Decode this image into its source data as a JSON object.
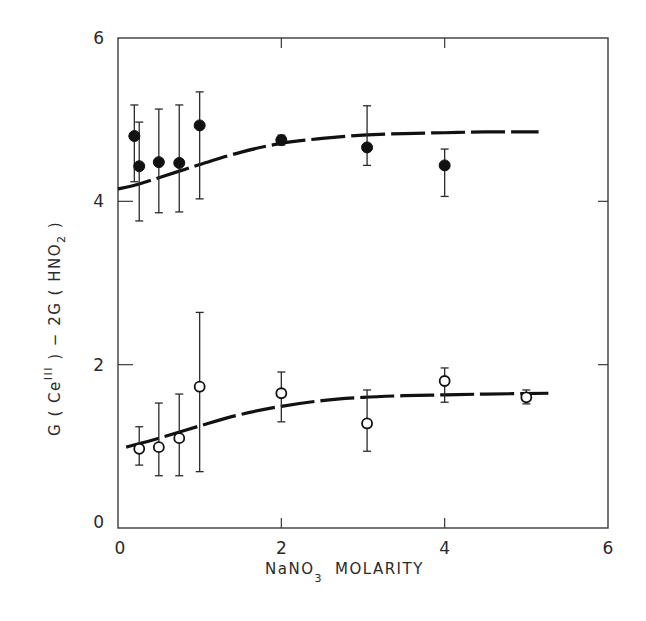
{
  "chart_data": {
    "type": "scatter",
    "title": "",
    "xlabel": "NaNO3 MOLARITY",
    "xlabel_parts": {
      "main": "NaNO",
      "sub": "3",
      "rest": "MOLARITY"
    },
    "ylabel": "G(Ce^III) - 2G(HNO2)",
    "ylabel_parts": [
      "G ( Ce",
      "III",
      " ) − 2G ( HNO",
      "2",
      " )"
    ],
    "xlim": [
      0,
      6
    ],
    "ylim": [
      0,
      6
    ],
    "x_ticks": [
      0,
      2,
      4,
      6
    ],
    "y_ticks": [
      0,
      2,
      4,
      6
    ],
    "x_tick_labels": [
      "0",
      "2",
      "4",
      "6"
    ],
    "y_tick_labels": [
      "0",
      "2",
      "4",
      "6"
    ],
    "grid": false,
    "legend": null,
    "series": [
      {
        "name": "filled circles (upper)",
        "marker": "filled-circle",
        "color": "#111111",
        "points": [
          {
            "x": 0.2,
            "y": 4.8,
            "err_low": 4.24,
            "err_high": 5.18
          },
          {
            "x": 0.26,
            "y": 4.43,
            "err_low": 3.76,
            "err_high": 4.97
          },
          {
            "x": 0.5,
            "y": 4.48,
            "err_low": 3.86,
            "err_high": 5.13
          },
          {
            "x": 0.75,
            "y": 4.47,
            "err_low": 3.87,
            "err_high": 5.18
          },
          {
            "x": 1.0,
            "y": 4.93,
            "err_low": 4.03,
            "err_high": 5.34
          },
          {
            "x": 2.0,
            "y": 4.75,
            "err_low": 4.69,
            "err_high": 4.81
          },
          {
            "x": 3.05,
            "y": 4.66,
            "err_low": 4.44,
            "err_high": 5.17
          },
          {
            "x": 4.0,
            "y": 4.44,
            "err_low": 4.06,
            "err_high": 4.64
          }
        ],
        "fit_curve": [
          [
            0.0,
            4.15
          ],
          [
            0.25,
            4.21
          ],
          [
            0.5,
            4.29
          ],
          [
            0.75,
            4.37
          ],
          [
            1.0,
            4.45
          ],
          [
            1.5,
            4.6
          ],
          [
            2.0,
            4.71
          ],
          [
            2.5,
            4.77
          ],
          [
            3.0,
            4.81
          ],
          [
            3.5,
            4.83
          ],
          [
            4.0,
            4.84
          ],
          [
            4.5,
            4.85
          ],
          [
            5.15,
            4.85
          ]
        ]
      },
      {
        "name": "open circles (lower)",
        "marker": "open-circle",
        "color": "#111111",
        "points": [
          {
            "x": 0.26,
            "y": 0.97,
            "err_low": 0.77,
            "err_high": 1.24
          },
          {
            "x": 0.5,
            "y": 0.99,
            "err_low": 0.64,
            "err_high": 1.53
          },
          {
            "x": 0.75,
            "y": 1.1,
            "err_low": 0.64,
            "err_high": 1.64
          },
          {
            "x": 1.0,
            "y": 1.73,
            "err_low": 0.69,
            "err_high": 2.64
          },
          {
            "x": 2.0,
            "y": 1.65,
            "err_low": 1.3,
            "err_high": 1.91
          },
          {
            "x": 3.05,
            "y": 1.28,
            "err_low": 0.94,
            "err_high": 1.69
          },
          {
            "x": 4.0,
            "y": 1.8,
            "err_low": 1.54,
            "err_high": 1.96
          },
          {
            "x": 5.0,
            "y": 1.6,
            "err_low": 1.52,
            "err_high": 1.69
          }
        ],
        "fit_curve": [
          [
            0.1,
            0.99
          ],
          [
            0.5,
            1.1
          ],
          [
            1.0,
            1.25
          ],
          [
            1.5,
            1.39
          ],
          [
            2.0,
            1.49
          ],
          [
            2.5,
            1.56
          ],
          [
            3.0,
            1.6
          ],
          [
            3.5,
            1.62
          ],
          [
            4.0,
            1.63
          ],
          [
            4.5,
            1.64
          ],
          [
            5.27,
            1.65
          ]
        ]
      }
    ]
  }
}
